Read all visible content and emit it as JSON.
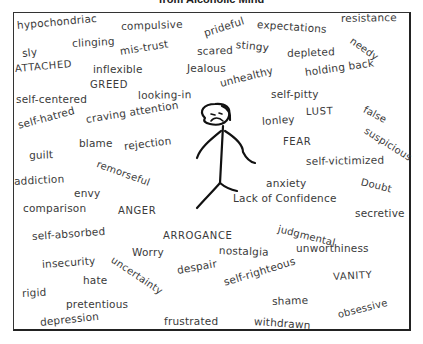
{
  "title": "from Alcoholic Mind",
  "words": [
    {
      "text": "hypochondriac",
      "x": 17,
      "y": 20,
      "rot": -5,
      "size": 10.5
    },
    {
      "text": "compulsive",
      "x": 121,
      "y": 21,
      "rot": -2,
      "size": 10.5
    },
    {
      "text": "prideful",
      "x": 204,
      "y": 28,
      "rot": -18,
      "size": 10.5
    },
    {
      "text": "expectations",
      "x": 257,
      "y": 19,
      "rot": 4,
      "size": 10.5
    },
    {
      "text": "resistance",
      "x": 341,
      "y": 13,
      "rot": -1,
      "size": 10.5
    },
    {
      "text": "stingy",
      "x": 236,
      "y": 39,
      "rot": 6,
      "size": 10.5
    },
    {
      "text": "needy",
      "x": 351,
      "y": 35,
      "rot": 35,
      "size": 10
    },
    {
      "text": "clinging",
      "x": 72,
      "y": 38,
      "rot": -3,
      "size": 10.5
    },
    {
      "text": "sly",
      "x": 22,
      "y": 48,
      "rot": -6,
      "size": 10.5
    },
    {
      "text": "mis-trust",
      "x": 120,
      "y": 46,
      "rot": -9,
      "size": 10.5
    },
    {
      "text": "scared",
      "x": 197,
      "y": 46,
      "rot": -2,
      "size": 10.5
    },
    {
      "text": "depleted",
      "x": 287,
      "y": 48,
      "rot": -2,
      "size": 10.5
    },
    {
      "text": "ATTACHED",
      "x": 15,
      "y": 64,
      "rot": -5,
      "size": 10,
      "caps": true
    },
    {
      "text": "inflexible",
      "x": 93,
      "y": 64,
      "rot": 0,
      "size": 10.5
    },
    {
      "text": "Jealous",
      "x": 187,
      "y": 63,
      "rot": 0,
      "size": 10.5
    },
    {
      "text": "unhealthy",
      "x": 220,
      "y": 78,
      "rot": -14,
      "size": 10.5
    },
    {
      "text": "holding back",
      "x": 305,
      "y": 67,
      "rot": -8,
      "size": 10.5
    },
    {
      "text": "GREED",
      "x": 90,
      "y": 80,
      "rot": 0,
      "size": 10,
      "caps": true
    },
    {
      "text": "self-centered",
      "x": 16,
      "y": 94,
      "rot": 0,
      "size": 10.5
    },
    {
      "text": "looking-in",
      "x": 138,
      "y": 90,
      "rot": -1,
      "size": 10.5
    },
    {
      "text": "self-pitty",
      "x": 271,
      "y": 89,
      "rot": 0,
      "size": 10.5
    },
    {
      "text": "LUST",
      "x": 306,
      "y": 107,
      "rot": -2,
      "size": 10,
      "caps": true
    },
    {
      "text": "false",
      "x": 364,
      "y": 104,
      "rot": 28,
      "size": 10
    },
    {
      "text": "self-hatred",
      "x": 18,
      "y": 120,
      "rot": -15,
      "size": 10.5
    },
    {
      "text": "craving attention",
      "x": 86,
      "y": 114,
      "rot": -9,
      "size": 10.5
    },
    {
      "text": "lonley",
      "x": 262,
      "y": 116,
      "rot": -4,
      "size": 10.5
    },
    {
      "text": "suspicious",
      "x": 365,
      "y": 125,
      "rot": 32,
      "size": 10
    },
    {
      "text": "blame",
      "x": 79,
      "y": 138,
      "rot": 0,
      "size": 10.5
    },
    {
      "text": "rejection",
      "x": 124,
      "y": 141,
      "rot": -7,
      "size": 10.5
    },
    {
      "text": "FEAR",
      "x": 283,
      "y": 137,
      "rot": 0,
      "size": 10,
      "caps": true
    },
    {
      "text": "guilt",
      "x": 29,
      "y": 150,
      "rot": -2,
      "size": 10.5
    },
    {
      "text": "remorseful",
      "x": 97,
      "y": 159,
      "rot": 20,
      "size": 10
    },
    {
      "text": "self-victimized",
      "x": 306,
      "y": 156,
      "rot": -1,
      "size": 10.5
    },
    {
      "text": "addiction",
      "x": 14,
      "y": 176,
      "rot": -3,
      "size": 10.5
    },
    {
      "text": "anxiety",
      "x": 266,
      "y": 178,
      "rot": 0,
      "size": 10.5
    },
    {
      "text": "Doubt",
      "x": 361,
      "y": 177,
      "rot": 14,
      "size": 10
    },
    {
      "text": "envy",
      "x": 74,
      "y": 188,
      "rot": 0,
      "size": 10.5
    },
    {
      "text": "Lack of Confidence",
      "x": 233,
      "y": 193,
      "rot": 0,
      "size": 10.5
    },
    {
      "text": "comparison",
      "x": 23,
      "y": 203,
      "rot": 0,
      "size": 10.5
    },
    {
      "text": "ANGER",
      "x": 118,
      "y": 206,
      "rot": 0,
      "size": 10,
      "caps": true
    },
    {
      "text": "secretive",
      "x": 355,
      "y": 208,
      "rot": 0,
      "size": 10.5
    },
    {
      "text": "judgmental",
      "x": 278,
      "y": 224,
      "rot": 14,
      "size": 10
    },
    {
      "text": "self-absorbed",
      "x": 32,
      "y": 231,
      "rot": -4,
      "size": 10.5
    },
    {
      "text": "ARROGANCE",
      "x": 163,
      "y": 231,
      "rot": 0,
      "size": 10,
      "caps": true
    },
    {
      "text": "Worry",
      "x": 132,
      "y": 247,
      "rot": 0,
      "size": 10.5
    },
    {
      "text": "nostalgia",
      "x": 219,
      "y": 245,
      "rot": 2,
      "size": 10.5
    },
    {
      "text": "unworthiness",
      "x": 296,
      "y": 243,
      "rot": 0,
      "size": 10.5
    },
    {
      "text": "insecurity",
      "x": 42,
      "y": 259,
      "rot": -4,
      "size": 10.5
    },
    {
      "text": "uncertainty",
      "x": 112,
      "y": 254,
      "rot": 34,
      "size": 10
    },
    {
      "text": "despair",
      "x": 177,
      "y": 265,
      "rot": -10,
      "size": 10.5
    },
    {
      "text": "hate",
      "x": 83,
      "y": 275,
      "rot": 0,
      "size": 10.5
    },
    {
      "text": "self-righteous",
      "x": 224,
      "y": 277,
      "rot": -17,
      "size": 10.5
    },
    {
      "text": "VANITY",
      "x": 333,
      "y": 272,
      "rot": -3,
      "size": 10,
      "caps": true
    },
    {
      "text": "rigid",
      "x": 22,
      "y": 288,
      "rot": -3,
      "size": 10.5
    },
    {
      "text": "shame",
      "x": 272,
      "y": 296,
      "rot": -2,
      "size": 10.5
    },
    {
      "text": "pretentious",
      "x": 66,
      "y": 299,
      "rot": 0,
      "size": 10.5
    },
    {
      "text": "obsessive",
      "x": 338,
      "y": 310,
      "rot": -14,
      "size": 10
    },
    {
      "text": "depression",
      "x": 40,
      "y": 317,
      "rot": -6,
      "size": 10.5
    },
    {
      "text": "frustrated",
      "x": 164,
      "y": 316,
      "rot": 0,
      "size": 10.5
    },
    {
      "text": "withdrawn",
      "x": 254,
      "y": 316,
      "rot": 4,
      "size": 10.5
    }
  ],
  "figure": {
    "stroke_color": "#111111"
  }
}
